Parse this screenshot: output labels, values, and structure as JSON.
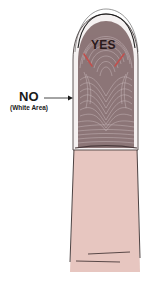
{
  "diagram": {
    "labels": {
      "yes": "YES",
      "no": "NO",
      "no_sub": "(White Area)"
    },
    "colors": {
      "fingerprint": "#8c7677",
      "ridge": "#5e4a4c",
      "skin": "#e7c6c0",
      "outline": "#2b2b2b",
      "yes_marks": "#c0504d",
      "white_edge": "#f4f1f1"
    }
  }
}
